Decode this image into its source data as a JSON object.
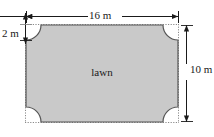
{
  "figure": {
    "kind": "geometry-diagram",
    "subject": "lawn",
    "shape_label": "lawn",
    "colors": {
      "fill": "#c9c9c9",
      "outline": "#555555",
      "dimension_line": "#1a1a1a",
      "construction_line": "#8a8a8a",
      "background": "#ffffff",
      "text": "#1a1a1a"
    },
    "dimensions": [
      {
        "id": "width",
        "label": "16 m",
        "value": 16,
        "unit": "m",
        "orientation": "horizontal",
        "position": "top"
      },
      {
        "id": "height",
        "label": "10 m",
        "value": 10,
        "unit": "m",
        "orientation": "vertical",
        "position": "right"
      },
      {
        "id": "corner-radius",
        "label": "2 m",
        "value": 2,
        "unit": "m",
        "orientation": "vertical",
        "position": "top-left"
      }
    ],
    "geometry": {
      "rect_x": 26,
      "rect_y": 25,
      "rect_width": 152,
      "rect_height": 97,
      "corner_radius": 15,
      "top_dim_y": 16,
      "right_dim_x": 186,
      "left_dim_x": 25,
      "left_dim_top": 20,
      "left_dim_bottom": 44
    }
  }
}
